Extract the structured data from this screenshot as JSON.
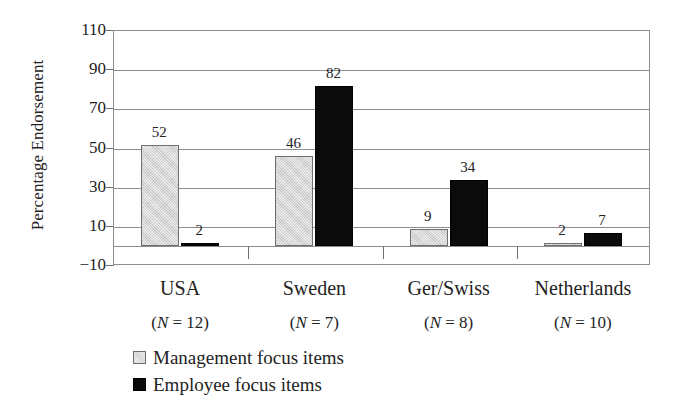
{
  "chart_data": {
    "type": "bar",
    "title": "",
    "subtitle": "",
    "xlabel": "",
    "ylabel": "Percentage Endorsement",
    "ylim": [
      -10,
      110
    ],
    "ytick_step": 20,
    "yticks": [
      110,
      90,
      70,
      50,
      30,
      10,
      -10
    ],
    "ytick_labels": [
      "110",
      "90",
      "70",
      "50",
      "30",
      "10",
      "−10"
    ],
    "grid": true,
    "legend_position": "bottom-left",
    "categories": [
      "USA",
      "Sweden",
      "Ger/Swiss",
      "Netherlands"
    ],
    "category_sublabels": [
      "(N = 12)",
      "(N = 7)",
      "(N = 8)",
      "(N = 10)"
    ],
    "category_n": [
      12,
      7,
      8,
      10
    ],
    "series": [
      {
        "name": "Management focus items",
        "color": "#d4d4d4",
        "values": [
          52,
          46,
          9,
          2
        ],
        "value_labels": [
          "52",
          "46",
          "9",
          "2"
        ]
      },
      {
        "name": "Employee focus items",
        "color": "#0b0b0b",
        "values": [
          2,
          82,
          34,
          7
        ],
        "value_labels": [
          "2",
          "82",
          "34",
          "7"
        ]
      }
    ]
  },
  "axis": {
    "y_title": "Percentage Endorsement"
  },
  "legend": {
    "items": [
      {
        "label": "Management focus items",
        "swatch": "management-swatch"
      },
      {
        "label": "Employee focus items",
        "swatch": "employee-swatch"
      }
    ]
  }
}
